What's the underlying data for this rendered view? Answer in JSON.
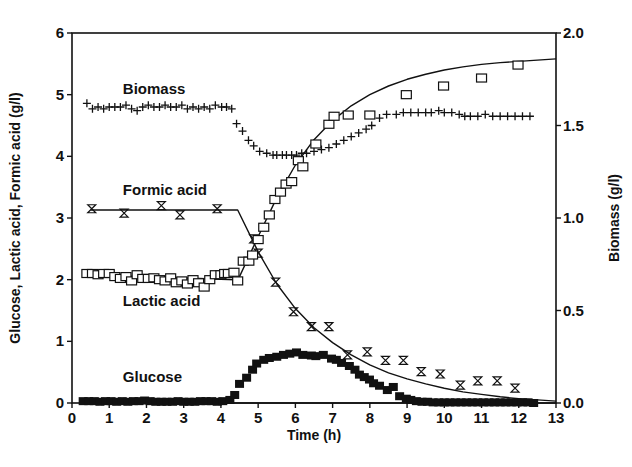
{
  "chart_data": {
    "type": "scatter",
    "title": "",
    "xlabel": "Time (h)",
    "ylabel": "Glucose, Lactic acid, Formic acid (g/l)",
    "y2label": "Biomass (g/l)",
    "xlim": [
      0,
      13
    ],
    "ylim": [
      0,
      6
    ],
    "y2lim": [
      0.0,
      2.0
    ],
    "xticks": [
      0,
      1,
      2,
      3,
      4,
      5,
      6,
      7,
      8,
      9,
      10,
      11,
      12,
      13
    ],
    "yticks": [
      0,
      1,
      2,
      3,
      4,
      5,
      6
    ],
    "y2ticks": [
      "0.0",
      "0.5",
      "1.0",
      "1.5",
      "2.0"
    ],
    "grid": false,
    "legend": "inline labels",
    "annotations": [
      {
        "text": "Biomass",
        "x": 1.5,
        "y": 5.1
      },
      {
        "text": "Formic acid",
        "x": 1.5,
        "y": 3.45
      },
      {
        "text": "Lactic acid",
        "x": 1.5,
        "y": 1.65
      },
      {
        "text": "Glucose",
        "x": 1.5,
        "y": 0.42
      }
    ],
    "series": [
      {
        "name": "Biomass",
        "axis": "right",
        "marker": "plus",
        "x": [
          0.4,
          0.55,
          0.7,
          0.85,
          1.0,
          1.15,
          1.3,
          1.45,
          1.6,
          1.75,
          1.9,
          2.05,
          2.2,
          2.35,
          2.5,
          2.65,
          2.8,
          2.95,
          3.1,
          3.25,
          3.4,
          3.55,
          3.7,
          3.85,
          4.02,
          4.15,
          4.29,
          4.42,
          4.58,
          4.74,
          4.88,
          5.04,
          5.23,
          5.4,
          5.5,
          5.65,
          5.76,
          5.9,
          6.03,
          6.17,
          6.3,
          6.5,
          6.7,
          6.9,
          7.1,
          7.3,
          7.5,
          7.7,
          7.9,
          8.05,
          8.26,
          8.45,
          8.71,
          8.9,
          9.1,
          9.3,
          9.5,
          9.65,
          9.85,
          10.0,
          10.2,
          10.4,
          10.55,
          10.7,
          10.9,
          11.1,
          11.3,
          11.5,
          11.7,
          11.9,
          12.1,
          12.3
        ],
        "values": [
          1.62,
          1.59,
          1.6,
          1.59,
          1.6,
          1.6,
          1.6,
          1.61,
          1.59,
          1.58,
          1.6,
          1.61,
          1.6,
          1.6,
          1.61,
          1.6,
          1.6,
          1.61,
          1.59,
          1.6,
          1.59,
          1.6,
          1.59,
          1.61,
          1.6,
          1.6,
          1.59,
          1.51,
          1.47,
          1.42,
          1.39,
          1.36,
          1.35,
          1.34,
          1.34,
          1.34,
          1.34,
          1.34,
          1.34,
          1.35,
          1.35,
          1.36,
          1.37,
          1.38,
          1.4,
          1.42,
          1.44,
          1.46,
          1.48,
          1.5,
          1.54,
          1.56,
          1.56,
          1.57,
          1.57,
          1.57,
          1.57,
          1.57,
          1.58,
          1.57,
          1.57,
          1.56,
          1.55,
          1.55,
          1.55,
          1.56,
          1.55,
          1.55,
          1.55,
          1.55,
          1.55,
          1.55
        ]
      },
      {
        "name": "Formic acid",
        "axis": "left",
        "marker": "hourglass",
        "x": [
          0.53,
          1.4,
          2.4,
          2.9,
          3.9,
          4.88,
          5.0,
          5.47,
          5.95,
          6.43,
          6.9,
          7.4,
          7.93,
          8.42,
          8.9,
          9.38,
          9.89,
          10.43,
          10.9,
          11.42,
          11.9
        ],
        "values": [
          3.15,
          3.08,
          3.2,
          3.05,
          3.15,
          2.66,
          2.43,
          1.96,
          1.48,
          1.24,
          1.24,
          0.78,
          0.83,
          0.69,
          0.69,
          0.51,
          0.47,
          0.29,
          0.36,
          0.36,
          0.24
        ],
        "fit": {
          "x": [
            0.5,
            4.45,
            5.0,
            5.5,
            6.0,
            6.5,
            7.0,
            7.5,
            8.0,
            8.5,
            9.0,
            9.5,
            10.0,
            10.5,
            11.0,
            11.5,
            12.0,
            12.5,
            13.0
          ],
          "values": [
            3.13,
            3.13,
            2.45,
            1.93,
            1.53,
            1.22,
            0.98,
            0.78,
            0.62,
            0.49,
            0.39,
            0.31,
            0.24,
            0.18,
            0.14,
            0.1,
            0.07,
            0.05,
            0.03
          ]
        }
      },
      {
        "name": "Lactic acid",
        "axis": "left",
        "marker": "open-square",
        "x": [
          0.4,
          0.55,
          0.7,
          0.85,
          1.0,
          1.15,
          1.3,
          1.45,
          1.6,
          1.75,
          1.9,
          2.05,
          2.2,
          2.35,
          2.5,
          2.65,
          2.8,
          2.95,
          3.1,
          3.25,
          3.4,
          3.55,
          3.7,
          3.85,
          4.0,
          4.1,
          4.2,
          4.35,
          4.45,
          4.6,
          4.75,
          4.85,
          5.0,
          5.15,
          5.3,
          5.45,
          5.6,
          5.75,
          5.9,
          6.08,
          6.2,
          6.55,
          6.9,
          7.04,
          7.42,
          8.0,
          8.98,
          9.98,
          11.0,
          11.98
        ],
        "values": [
          2.1,
          2.1,
          2.08,
          2.1,
          2.1,
          2.05,
          2.02,
          2.05,
          1.98,
          2.08,
          2.02,
          2.02,
          2.03,
          2.0,
          1.98,
          2.03,
          1.95,
          1.98,
          1.93,
          2.0,
          1.95,
          1.88,
          2.0,
          2.08,
          2.08,
          2.1,
          2.1,
          2.12,
          1.98,
          2.3,
          2.3,
          2.4,
          2.65,
          2.85,
          3.05,
          3.3,
          3.42,
          3.55,
          3.59,
          3.93,
          3.83,
          4.2,
          4.52,
          4.65,
          4.67,
          4.67,
          5.0,
          5.14,
          5.27,
          5.48
        ],
        "fit": {
          "x": [
            0.4,
            4.4,
            4.5,
            5.0,
            5.5,
            6.0,
            6.5,
            7.0,
            7.5,
            8.0,
            8.5,
            9.0,
            9.5,
            10.0,
            10.5,
            11.0,
            11.5,
            12.0,
            12.5,
            13.0
          ],
          "values": [
            2.08,
            2.0,
            2.05,
            2.7,
            3.33,
            3.86,
            4.27,
            4.58,
            4.82,
            5.0,
            5.14,
            5.25,
            5.33,
            5.4,
            5.45,
            5.49,
            5.52,
            5.54,
            5.56,
            5.58
          ]
        }
      },
      {
        "name": "Glucose",
        "axis": "left",
        "marker": "filled-square",
        "x": [
          0.3,
          0.45,
          0.6,
          0.75,
          0.9,
          1.05,
          1.2,
          1.35,
          1.5,
          1.65,
          1.8,
          1.95,
          2.1,
          2.25,
          2.4,
          2.55,
          2.7,
          2.85,
          3.0,
          3.15,
          3.3,
          3.45,
          3.6,
          3.75,
          3.9,
          4.05,
          4.24,
          4.37,
          4.5,
          4.69,
          4.85,
          4.96,
          5.15,
          5.3,
          5.5,
          5.68,
          5.85,
          6.03,
          6.2,
          6.43,
          6.55,
          6.75,
          6.97,
          7.1,
          7.24,
          7.45,
          7.6,
          7.72,
          7.85,
          7.99,
          8.1,
          8.26,
          8.47,
          8.63,
          8.8,
          8.98,
          9.1,
          9.25,
          9.4,
          9.55,
          9.7,
          9.85,
          10.0,
          10.15,
          10.3,
          10.45,
          10.6,
          10.75,
          10.9,
          11.05,
          11.2,
          11.35,
          11.5,
          11.65,
          11.8,
          11.95,
          12.1,
          12.25,
          12.4
        ],
        "values": [
          0.03,
          0.03,
          0.03,
          0.02,
          0.03,
          0.03,
          0.02,
          0.03,
          0.02,
          0.03,
          0.03,
          0.04,
          0.03,
          0.02,
          0.02,
          0.02,
          0.02,
          0.03,
          0.02,
          0.02,
          0.02,
          0.03,
          0.03,
          0.03,
          0.02,
          0.03,
          0.05,
          0.13,
          0.31,
          0.41,
          0.54,
          0.64,
          0.7,
          0.73,
          0.75,
          0.78,
          0.8,
          0.82,
          0.78,
          0.77,
          0.76,
          0.78,
          0.72,
          0.7,
          0.65,
          0.6,
          0.54,
          0.46,
          0.42,
          0.38,
          0.32,
          0.28,
          0.21,
          0.26,
          0.11,
          0.07,
          0.05,
          0.03,
          0.02,
          0.02,
          0.01,
          0.01,
          0.01,
          0.01,
          0.01,
          0.01,
          0.01,
          0.01,
          0.01,
          0.01,
          0.01,
          0.01,
          0.01,
          0.01,
          0.01,
          0.01,
          0.01,
          0.01,
          0.0
        ],
        "fit": {
          "x": [
            0.3,
            4.3,
            13.0
          ],
          "values": [
            0.0,
            0.0,
            0.0
          ]
        }
      }
    ]
  },
  "style": {
    "ink_color": "#111111",
    "background": "#ffffff"
  }
}
